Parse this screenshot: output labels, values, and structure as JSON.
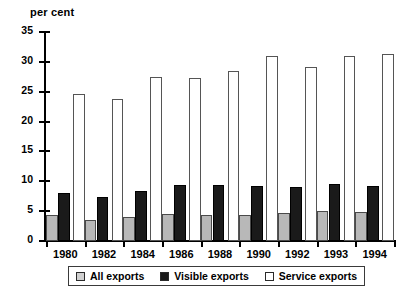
{
  "chart_data": {
    "type": "bar",
    "title": "",
    "ylabel": "per cent",
    "xlabel": "",
    "ylim": [
      0,
      35
    ],
    "yticks": [
      0,
      5,
      10,
      15,
      20,
      25,
      30,
      35
    ],
    "grid": false,
    "legend_position": "bottom",
    "categories": [
      "1980",
      "1982",
      "1984",
      "1986",
      "1988",
      "1990",
      "1992",
      "1993",
      "1994"
    ],
    "series": [
      {
        "name": "All exports",
        "color": "#b8b8b8",
        "values": [
          4.3,
          3.5,
          4.0,
          4.6,
          4.4,
          4.4,
          4.7,
          5.0,
          4.8
        ]
      },
      {
        "name": "Visible exports",
        "color": "#1a1a1a",
        "values": [
          8.1,
          7.3,
          8.3,
          9.4,
          9.4,
          9.2,
          9.0,
          9.6,
          9.2
        ]
      },
      {
        "name": "Service exports",
        "color": "#ffffff",
        "values": [
          24.6,
          23.8,
          27.5,
          27.3,
          28.4,
          30.9,
          29.2,
          30.9,
          31.4
        ]
      }
    ]
  },
  "legend": {
    "items": [
      {
        "label": "All exports",
        "key": "all"
      },
      {
        "label": "Visible exports",
        "key": "visible"
      },
      {
        "label": "Service exports",
        "key": "service"
      }
    ]
  }
}
